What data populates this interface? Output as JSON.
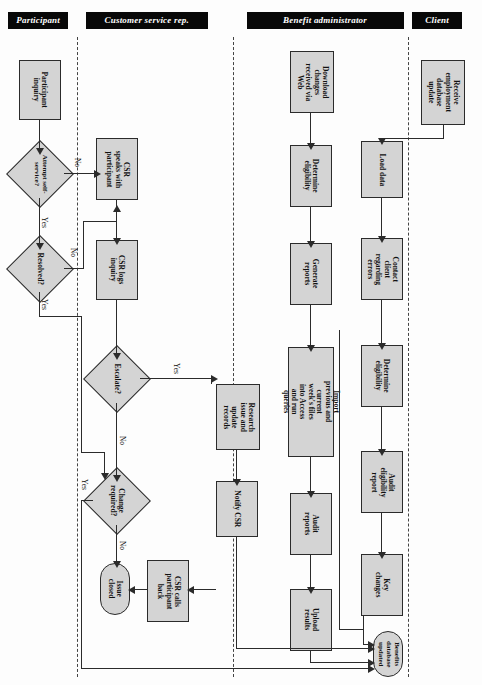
{
  "diagram": {
    "orientation": "rotated-180",
    "lanes": [
      {
        "id": "client",
        "label": "Client"
      },
      {
        "id": "benefit-administrator",
        "label": "Benefit administrator"
      },
      {
        "id": "customer-service-rep",
        "label": "Customer service rep."
      },
      {
        "id": "participant",
        "label": "Participant"
      }
    ],
    "nodes": [
      {
        "id": "receive-employment-database-update",
        "lane": "client",
        "type": "process",
        "label": "Receive employment database update"
      },
      {
        "id": "load-data",
        "lane": "benefit-administrator",
        "type": "process",
        "label": "Load data"
      },
      {
        "id": "contact-client-regarding-errors",
        "lane": "benefit-administrator",
        "type": "process",
        "label": "Contact client regarding errors"
      },
      {
        "id": "determine-eligibility-top",
        "lane": "benefit-administrator",
        "type": "process",
        "label": "Determine eligibility"
      },
      {
        "id": "audit-eligibility-report",
        "lane": "benefit-administrator",
        "type": "process",
        "label": "Audit eligibility report"
      },
      {
        "id": "key-changes",
        "lane": "benefit-administrator",
        "type": "process",
        "label": "Key changes"
      },
      {
        "id": "benefits-database-updated",
        "lane": "benefit-administrator",
        "type": "terminator",
        "label": "Benefits database updated"
      },
      {
        "id": "download-changes-received-via-web",
        "lane": "benefit-administrator",
        "type": "process",
        "label": "Download changes received via Web"
      },
      {
        "id": "determine-eligibility-bottom",
        "lane": "benefit-administrator",
        "type": "process",
        "label": "Determine eligibility"
      },
      {
        "id": "generate-reports",
        "lane": "benefit-administrator",
        "type": "process",
        "label": "Generate reports"
      },
      {
        "id": "import-files-run-queries",
        "lane": "benefit-administrator",
        "type": "process",
        "label": "Import previous and current week's files into Access and run queries"
      },
      {
        "id": "audit-reports",
        "lane": "benefit-administrator",
        "type": "process",
        "label": "Audit reports"
      },
      {
        "id": "upload-results",
        "lane": "benefit-administrator",
        "type": "process",
        "label": "Upload results"
      },
      {
        "id": "research-issue-and-update-records",
        "lane": "benefit-administrator",
        "type": "process",
        "label": "Research issue and update records"
      },
      {
        "id": "notify-csr",
        "lane": "benefit-administrator",
        "type": "process",
        "label": "Notify CSR"
      },
      {
        "id": "csr-logs-inquiry",
        "lane": "customer-service-rep",
        "type": "process",
        "label": "CSR logs inquiry"
      },
      {
        "id": "csr-speaks-with-participant",
        "lane": "customer-service-rep",
        "type": "process",
        "label": "CSR speaks with participant"
      },
      {
        "id": "escalate",
        "lane": "customer-service-rep",
        "type": "decision",
        "label": "Escalate?"
      },
      {
        "id": "change-required",
        "lane": "customer-service-rep",
        "type": "decision",
        "label": "Change required?"
      },
      {
        "id": "csr-calls-participant-back",
        "lane": "customer-service-rep",
        "type": "process",
        "label": "CSR calls participant back"
      },
      {
        "id": "issue-closed",
        "lane": "customer-service-rep",
        "type": "terminator",
        "label": "Issue closed"
      },
      {
        "id": "participant-inquiry",
        "lane": "participant",
        "type": "process",
        "label": "Participant inquiry"
      },
      {
        "id": "attempt-self-service",
        "lane": "participant",
        "type": "decision",
        "label": "Attempt self-service?"
      },
      {
        "id": "resolved",
        "lane": "participant",
        "type": "decision",
        "label": "Resolved?"
      }
    ],
    "edge_labels": {
      "escalate_yes": "Yes",
      "escalate_no": "No",
      "change_required_yes": "Yes",
      "change_required_no": "No",
      "attempt_self_service_yes": "Yes",
      "attempt_self_service_no": "No",
      "resolved_yes": "Yes",
      "resolved_no": "No"
    },
    "colors": {
      "node_fill": "#d4d4d4",
      "node_stroke": "#2b2b2b",
      "lane_label_bg": "#080808",
      "lane_label_fg": "#ffffff",
      "background": "#fdfdfd"
    }
  }
}
